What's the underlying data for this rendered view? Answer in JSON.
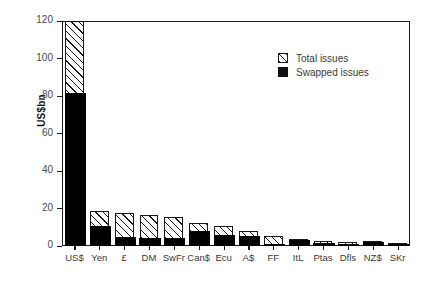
{
  "chart_data": {
    "type": "bar",
    "subtype": "stacked-bar",
    "title": "",
    "xlabel": "",
    "ylabel": "US$bn",
    "ylim": [
      0,
      120
    ],
    "yticks": [
      0,
      20,
      40,
      60,
      80,
      100,
      120
    ],
    "ytick_labels": [
      "0",
      "20",
      "40",
      "60",
      "80",
      "100",
      "120"
    ],
    "grid": false,
    "legend_position": "upper-right-inside",
    "categories": [
      "US$",
      "Yen",
      "£",
      "DM",
      "SwFr",
      "Can$",
      "Ecu",
      "A$",
      "FF",
      "ItL",
      "Ptas",
      "Dfls",
      "NZ$",
      "SKr"
    ],
    "series": [
      {
        "name": "Total issues",
        "fill": "hatched",
        "values": [
          120,
          18.5,
          17.5,
          16.5,
          15.5,
          12.5,
          10.5,
          8,
          5.5,
          4,
          2.5,
          2,
          2.5,
          1.2
        ]
      },
      {
        "name": "Swapped issues",
        "fill": "solid-black",
        "values": [
          81.5,
          10.5,
          5,
          4.5,
          4.5,
          8,
          6,
          5.5,
          0.5,
          3,
          1.5,
          1,
          2,
          0.4
        ]
      }
    ]
  },
  "legend": {
    "items": [
      {
        "label": "Total issues",
        "swatch": "hatched-square-icon"
      },
      {
        "label": "Swapped issues",
        "swatch": "filled-square-icon"
      }
    ]
  },
  "axes": {
    "y_title": "US$bn"
  },
  "colors": {
    "axis": "#1a1a1a",
    "bar_outline": "#1a1a1a",
    "swapped_fill": "#000000",
    "total_fill": "#ffffff",
    "tick_label": "#4a4a4a",
    "background": "#ffffff"
  }
}
